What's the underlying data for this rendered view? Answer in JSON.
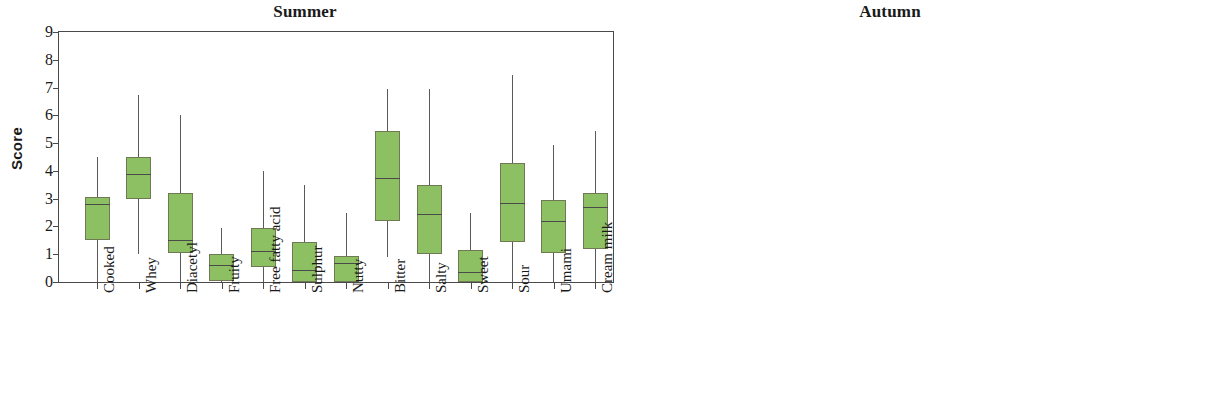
{
  "figure": {
    "ylabel": "Score",
    "yticks": [
      0,
      1,
      2,
      3,
      4,
      5,
      6,
      7,
      8,
      9
    ],
    "categories": [
      "Cooked",
      "Whey",
      "Diacetyl",
      "Fruity",
      "Free fatty acid",
      "Sulphur",
      "Nutty",
      "Bitter",
      "Salty",
      "Sweet",
      "Sour",
      "Umami",
      "Cream milk"
    ],
    "colors": {
      "summer_fill": "#8DC063",
      "autumn_fill": "#F7F5B0",
      "box_stroke": "#6f7a55",
      "whisker": "#5a5a5a",
      "axis": "#4a4a4a"
    }
  },
  "chart_data": [
    {
      "type": "box",
      "title": "Summer",
      "ylabel": "Score",
      "xlabel": "",
      "ylim": [
        0,
        9
      ],
      "grid": false,
      "legend": "none",
      "fill_color": "#8DC063",
      "categories": [
        "Cooked",
        "Whey",
        "Diacetyl",
        "Fruity",
        "Free fatty acid",
        "Sulphur",
        "Nutty",
        "Bitter",
        "Salty",
        "Sweet",
        "Sour",
        "Umami",
        "Cream milk"
      ],
      "boxes": [
        {
          "category": "Cooked",
          "min": 0.0,
          "q1": 1.5,
          "median": 2.8,
          "q3": 3.05,
          "max": 4.5
        },
        {
          "category": "Whey",
          "min": 1.0,
          "q1": 3.0,
          "median": 3.9,
          "q3": 4.5,
          "max": 6.75
        },
        {
          "category": "Diacetyl",
          "min": 0.0,
          "q1": 1.05,
          "median": 1.5,
          "q3": 3.2,
          "max": 6.0
        },
        {
          "category": "Fruity",
          "min": 0.0,
          "q1": 0.05,
          "median": 0.6,
          "q3": 1.0,
          "max": 1.95
        },
        {
          "category": "Free fatty acid",
          "min": 0.0,
          "q1": 0.55,
          "median": 1.1,
          "q3": 1.95,
          "max": 4.0
        },
        {
          "category": "Sulphur",
          "min": 0.0,
          "q1": 0.0,
          "median": 0.45,
          "q3": 1.45,
          "max": 3.5
        },
        {
          "category": "Nutty",
          "min": 0.0,
          "q1": 0.0,
          "median": 0.7,
          "q3": 0.95,
          "max": 2.5
        },
        {
          "category": "Bitter",
          "min": 0.9,
          "q1": 2.2,
          "median": 3.75,
          "q3": 5.45,
          "max": 6.95
        },
        {
          "category": "Salty",
          "min": 0.0,
          "q1": 1.0,
          "median": 2.45,
          "q3": 3.5,
          "max": 6.95
        },
        {
          "category": "Sweet",
          "min": 0.0,
          "q1": 0.0,
          "median": 0.35,
          "q3": 1.15,
          "max": 2.5
        },
        {
          "category": "Sour",
          "min": 0.0,
          "q1": 1.45,
          "median": 2.85,
          "q3": 4.3,
          "max": 7.45
        },
        {
          "category": "Umami",
          "min": 0.0,
          "q1": 1.05,
          "median": 2.2,
          "q3": 2.95,
          "max": 4.95
        },
        {
          "category": "Cream milk",
          "min": 0.0,
          "q1": 1.2,
          "median": 2.7,
          "q3": 3.2,
          "max": 5.45
        }
      ]
    },
    {
      "type": "box",
      "title": "Autumn",
      "ylabel": "Score",
      "xlabel": "",
      "ylim": [
        0,
        9
      ],
      "grid": false,
      "legend": "none",
      "fill_color": "#F7F5B0",
      "categories": [
        "Cooked",
        "Whey",
        "Diacetyl",
        "Fruity",
        "Free fatty acid",
        "Sulphur",
        "Nutty",
        "Bitter",
        "Salty",
        "Sweet",
        "Sour",
        "Umami",
        "Cream milk"
      ],
      "boxes": [
        {
          "category": "Cooked",
          "min": 1.0,
          "q1": 1.0,
          "median": 2.0,
          "q3": 3.0,
          "max": 5.0
        },
        {
          "category": "Whey",
          "min": 1.0,
          "q1": 2.0,
          "median": 3.0,
          "q3": 4.0,
          "max": 5.0
        },
        {
          "category": "Diacetyl",
          "min": 0.0,
          "q1": 1.0,
          "median": 1.5,
          "q3": 2.0,
          "max": 3.0
        },
        {
          "category": "Fruity",
          "min": 0.3,
          "q1": 1.0,
          "median": 1.5,
          "q3": 2.0,
          "max": 3.0
        },
        {
          "category": "Free fatty acid",
          "min": 0.0,
          "q1": 0.35,
          "median": 0.6,
          "q3": 1.0,
          "max": 2.0
        },
        {
          "category": "Sulphur",
          "min": 0.0,
          "q1": 0.0,
          "median": 0.35,
          "q3": 0.7,
          "max": 1.0
        },
        {
          "category": "Nutty",
          "min": 0.0,
          "q1": 0.0,
          "median": 0.35,
          "q3": 1.0,
          "max": 2.0
        },
        {
          "category": "Bitter",
          "min": 0.6,
          "q1": 2.0,
          "median": 2.5,
          "q3": 3.0,
          "max": 4.0
        },
        {
          "category": "Salty",
          "min": 0.3,
          "q1": 1.0,
          "median": 2.0,
          "q3": 3.0,
          "max": 6.0
        },
        {
          "category": "Sweet",
          "min": 0.0,
          "q1": 0.35,
          "median": 0.55,
          "q3": 1.0,
          "max": 2.0
        },
        {
          "category": "Sour",
          "min": 0.6,
          "q1": 1.0,
          "median": 2.0,
          "q3": 3.0,
          "max": 4.0
        },
        {
          "category": "Umami",
          "min": 0.6,
          "q1": 1.0,
          "median": 2.0,
          "q3": 3.0,
          "max": 6.0
        },
        {
          "category": "Cream milk",
          "min": 0.0,
          "q1": 1.0,
          "median": 3.0,
          "q3": 3.95,
          "max": 6.95
        }
      ]
    }
  ]
}
